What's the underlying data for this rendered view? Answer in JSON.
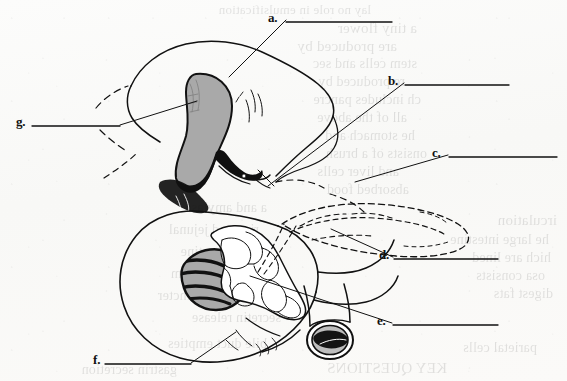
{
  "figure": {
    "kind": "anatomy-labeling-exercise",
    "ink_color": "#111111",
    "fill_gray": "#a8a8a8",
    "fill_dark": "#101010",
    "paper_color": "#fbfbfa"
  },
  "labels": [
    {
      "id": "a",
      "text": "a.",
      "x": 268,
      "y": 11,
      "rule_x1": 286,
      "rule_x2": 392,
      "rule_y": 22
    },
    {
      "id": "b",
      "text": "b.",
      "x": 388,
      "y": 74,
      "rule_x1": 405,
      "rule_x2": 509,
      "rule_y": 85
    },
    {
      "id": "c",
      "text": "c.",
      "x": 432,
      "y": 146,
      "rule_x1": 449,
      "rule_x2": 557,
      "rule_y": 157
    },
    {
      "id": "d",
      "text": "d.",
      "x": 379,
      "y": 248,
      "rule_x1": 394,
      "rule_x2": 498,
      "rule_y": 259
    },
    {
      "id": "e",
      "text": "e.",
      "x": 377,
      "y": 314,
      "rule_x1": 393,
      "rule_x2": 498,
      "rule_y": 325
    },
    {
      "id": "f",
      "text": "f.",
      "x": 93,
      "y": 353,
      "rule_x1": 105,
      "rule_x2": 191,
      "rule_y": 364
    },
    {
      "id": "g",
      "text": "g.",
      "x": 16,
      "y": 115,
      "rule_x1": 32,
      "rule_x2": 120,
      "rule_y": 126
    }
  ],
  "leader_lines": [
    {
      "for": "a",
      "points": "286,20 229,77"
    },
    {
      "for": "b",
      "points": "404,83 268,186"
    },
    {
      "for": "c",
      "points": "448,155 355,182"
    },
    {
      "for": "d",
      "points": "393,257 331,229"
    },
    {
      "for": "e",
      "points": "392,323 250,276"
    },
    {
      "for": "f",
      "points": "191,363 236,332"
    },
    {
      "for": "g",
      "points": "120,125 197,101"
    }
  ],
  "bleed_text": [
    {
      "x": 196,
      "y": 2,
      "text": "lay no role in emulsification",
      "size": 13
    },
    {
      "x": 150,
      "y": 20,
      "text": "a tiny flower",
      "size": 15
    },
    {
      "x": 170,
      "y": 38,
      "text": "are produced by",
      "size": 15
    },
    {
      "x": 150,
      "y": 56,
      "text": "stem cells and sec",
      "size": 14
    },
    {
      "x": 162,
      "y": 74,
      "text": "re produced by",
      "size": 14
    },
    {
      "x": 146,
      "y": 92,
      "text": "ch includes pancre",
      "size": 14
    },
    {
      "x": 160,
      "y": 110,
      "text": "all of the above",
      "size": 14
    },
    {
      "x": 152,
      "y": 128,
      "text": "he stomach and",
      "size": 14
    },
    {
      "x": 140,
      "y": 146,
      "text": "onsists of a brush",
      "size": 14
    },
    {
      "x": 168,
      "y": 164,
      "text": "and liver cells",
      "size": 14
    },
    {
      "x": 158,
      "y": 182,
      "text": "absorbed food",
      "size": 14
    },
    {
      "x": 10,
      "y": 212,
      "text": "irculation",
      "size": 15
    },
    {
      "x": 18,
      "y": 232,
      "text": "he large intestine",
      "size": 14
    },
    {
      "x": 16,
      "y": 250,
      "text": "hich are lined",
      "size": 14
    },
    {
      "x": 22,
      "y": 268,
      "text": "osa consists",
      "size": 14
    },
    {
      "x": 14,
      "y": 286,
      "text": "digest fats",
      "size": 14
    },
    {
      "x": 300,
      "y": 200,
      "text": "a and amylase",
      "size": 14
    },
    {
      "x": 308,
      "y": 222,
      "text": "rine and jejunal",
      "size": 14
    },
    {
      "x": 300,
      "y": 244,
      "text": "of the intestine",
      "size": 14
    },
    {
      "x": 296,
      "y": 266,
      "text": "colon and rectum",
      "size": 14
    },
    {
      "x": 290,
      "y": 288,
      "text": "the pyloric sphincter",
      "size": 14
    },
    {
      "x": 286,
      "y": 310,
      "text": "secretin release",
      "size": 14
    },
    {
      "x": 30,
      "y": 340,
      "text": "parietal cells",
      "size": 14
    },
    {
      "x": 300,
      "y": 336,
      "text": "bile duct empties",
      "size": 14
    },
    {
      "x": 120,
      "y": 360,
      "text": "KEY QUESTIONS",
      "size": 15
    },
    {
      "x": 390,
      "y": 362,
      "text": "gastrin secretion",
      "size": 14
    }
  ]
}
